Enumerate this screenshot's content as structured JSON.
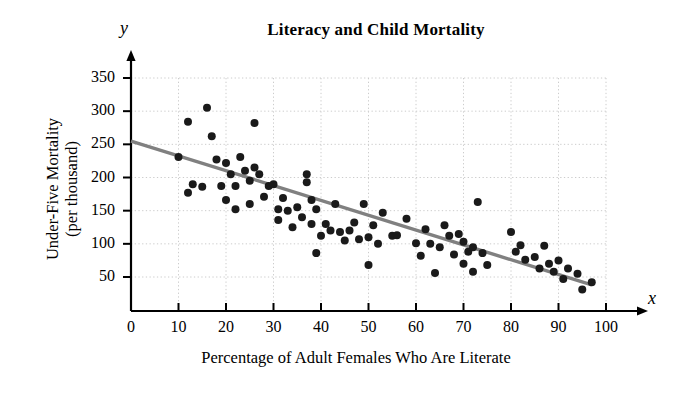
{
  "chart_data": {
    "type": "scatter",
    "title": "Literacy and Child Mortality",
    "xlabel": "Percentage of Adult Females Who Are Literate",
    "ylabel": "Under-Five Mortality\n(per thousand)",
    "x_axis_letter": "x",
    "y_axis_letter": "y",
    "xlim": [
      0,
      100
    ],
    "ylim": [
      0,
      360
    ],
    "xticks": [
      0,
      10,
      20,
      30,
      40,
      50,
      60,
      70,
      80,
      90,
      100
    ],
    "yticks": [
      50,
      100,
      150,
      200,
      250,
      300,
      350
    ],
    "grid": true,
    "grid_style": "dotted",
    "grid_color": "#cccccc",
    "marker_color": "#1a1a1a",
    "marker_size": 8,
    "trendline": {
      "label": "least-squares regression line",
      "color": "#808080",
      "x_start": 0,
      "y_start": 255,
      "x_end": 97,
      "y_end": 38
    },
    "points": [
      {
        "x": 10,
        "y": 231
      },
      {
        "x": 12,
        "y": 284
      },
      {
        "x": 12,
        "y": 177
      },
      {
        "x": 13,
        "y": 190
      },
      {
        "x": 15,
        "y": 186
      },
      {
        "x": 16,
        "y": 305
      },
      {
        "x": 17,
        "y": 262
      },
      {
        "x": 18,
        "y": 227
      },
      {
        "x": 19,
        "y": 187
      },
      {
        "x": 20,
        "y": 166
      },
      {
        "x": 20,
        "y": 222
      },
      {
        "x": 21,
        "y": 205
      },
      {
        "x": 22,
        "y": 187
      },
      {
        "x": 22,
        "y": 152
      },
      {
        "x": 23,
        "y": 231
      },
      {
        "x": 24,
        "y": 210
      },
      {
        "x": 25,
        "y": 160
      },
      {
        "x": 25,
        "y": 195
      },
      {
        "x": 26,
        "y": 282
      },
      {
        "x": 26,
        "y": 215
      },
      {
        "x": 27,
        "y": 205
      },
      {
        "x": 28,
        "y": 171
      },
      {
        "x": 29,
        "y": 187
      },
      {
        "x": 30,
        "y": 190
      },
      {
        "x": 31,
        "y": 152
      },
      {
        "x": 31,
        "y": 136
      },
      {
        "x": 32,
        "y": 169
      },
      {
        "x": 33,
        "y": 150
      },
      {
        "x": 34,
        "y": 125
      },
      {
        "x": 35,
        "y": 155
      },
      {
        "x": 36,
        "y": 140
      },
      {
        "x": 37,
        "y": 205
      },
      {
        "x": 37,
        "y": 193
      },
      {
        "x": 38,
        "y": 166
      },
      {
        "x": 38,
        "y": 130
      },
      {
        "x": 39,
        "y": 152
      },
      {
        "x": 39,
        "y": 86
      },
      {
        "x": 40,
        "y": 112
      },
      {
        "x": 41,
        "y": 130
      },
      {
        "x": 42,
        "y": 120
      },
      {
        "x": 43,
        "y": 160
      },
      {
        "x": 44,
        "y": 118
      },
      {
        "x": 45,
        "y": 105
      },
      {
        "x": 46,
        "y": 120
      },
      {
        "x": 47,
        "y": 132
      },
      {
        "x": 48,
        "y": 107
      },
      {
        "x": 49,
        "y": 160
      },
      {
        "x": 50,
        "y": 110
      },
      {
        "x": 50,
        "y": 68
      },
      {
        "x": 51,
        "y": 128
      },
      {
        "x": 52,
        "y": 100
      },
      {
        "x": 53,
        "y": 147
      },
      {
        "x": 55,
        "y": 112
      },
      {
        "x": 56,
        "y": 113
      },
      {
        "x": 58,
        "y": 138
      },
      {
        "x": 60,
        "y": 101
      },
      {
        "x": 61,
        "y": 82
      },
      {
        "x": 62,
        "y": 122
      },
      {
        "x": 63,
        "y": 100
      },
      {
        "x": 64,
        "y": 56
      },
      {
        "x": 65,
        "y": 95
      },
      {
        "x": 66,
        "y": 128
      },
      {
        "x": 67,
        "y": 112
      },
      {
        "x": 68,
        "y": 84
      },
      {
        "x": 69,
        "y": 115
      },
      {
        "x": 70,
        "y": 70
      },
      {
        "x": 70,
        "y": 103
      },
      {
        "x": 71,
        "y": 88
      },
      {
        "x": 72,
        "y": 58
      },
      {
        "x": 72,
        "y": 95
      },
      {
        "x": 73,
        "y": 163
      },
      {
        "x": 74,
        "y": 86
      },
      {
        "x": 75,
        "y": 68
      },
      {
        "x": 80,
        "y": 118
      },
      {
        "x": 81,
        "y": 88
      },
      {
        "x": 82,
        "y": 98
      },
      {
        "x": 83,
        "y": 76
      },
      {
        "x": 85,
        "y": 80
      },
      {
        "x": 86,
        "y": 63
      },
      {
        "x": 87,
        "y": 97
      },
      {
        "x": 88,
        "y": 70
      },
      {
        "x": 89,
        "y": 58
      },
      {
        "x": 90,
        "y": 75
      },
      {
        "x": 91,
        "y": 47
      },
      {
        "x": 92,
        "y": 63
      },
      {
        "x": 94,
        "y": 55
      },
      {
        "x": 95,
        "y": 31
      },
      {
        "x": 97,
        "y": 42
      }
    ]
  }
}
